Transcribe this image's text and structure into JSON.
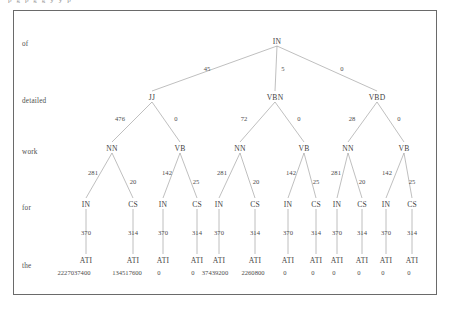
{
  "figure": {
    "caption_fragment": "p g p g g y y p",
    "row_labels": [
      {
        "text": "of",
        "x": 22,
        "y": 40
      },
      {
        "text": "detailed",
        "x": 22,
        "y": 97
      },
      {
        "text": "work",
        "x": 22,
        "y": 148
      },
      {
        "text": "for",
        "x": 22,
        "y": 204
      },
      {
        "text": "the",
        "x": 22,
        "y": 262
      }
    ],
    "nodes": [
      {
        "id": "root",
        "label": "IN",
        "x": 277,
        "y": 41
      },
      {
        "id": "l1a",
        "label": "JJ",
        "x": 152,
        "y": 97
      },
      {
        "id": "l1b",
        "label": "VBN",
        "x": 275,
        "y": 97
      },
      {
        "id": "l1c",
        "label": "VBD",
        "x": 377,
        "y": 97
      },
      {
        "id": "l2a",
        "label": "NN",
        "x": 112,
        "y": 148
      },
      {
        "id": "l2b",
        "label": "VB",
        "x": 180,
        "y": 148
      },
      {
        "id": "l2c",
        "label": "NN",
        "x": 240,
        "y": 148
      },
      {
        "id": "l2d",
        "label": "VB",
        "x": 304,
        "y": 148
      },
      {
        "id": "l2e",
        "label": "NN",
        "x": 348,
        "y": 148
      },
      {
        "id": "l2f",
        "label": "VB",
        "x": 404,
        "y": 148
      },
      {
        "id": "l3a",
        "label": "IN",
        "x": 86,
        "y": 204
      },
      {
        "id": "l3b",
        "label": "CS",
        "x": 133,
        "y": 204
      },
      {
        "id": "l3c",
        "label": "IN",
        "x": 163,
        "y": 204
      },
      {
        "id": "l3d",
        "label": "CS",
        "x": 197,
        "y": 204
      },
      {
        "id": "l3e",
        "label": "IN",
        "x": 219,
        "y": 204
      },
      {
        "id": "l3f",
        "label": "CS",
        "x": 255,
        "y": 204
      },
      {
        "id": "l3g",
        "label": "IN",
        "x": 288,
        "y": 204
      },
      {
        "id": "l3h",
        "label": "CS",
        "x": 316,
        "y": 204
      },
      {
        "id": "l3i",
        "label": "IN",
        "x": 337,
        "y": 204
      },
      {
        "id": "l3j",
        "label": "CS",
        "x": 362,
        "y": 204
      },
      {
        "id": "l3k",
        "label": "IN",
        "x": 386,
        "y": 204
      },
      {
        "id": "l3l",
        "label": "CS",
        "x": 412,
        "y": 204
      },
      {
        "id": "l4a",
        "label": "ATI",
        "x": 86,
        "y": 260
      },
      {
        "id": "l4b",
        "label": "ATI",
        "x": 133,
        "y": 260
      },
      {
        "id": "l4c",
        "label": "ATI",
        "x": 163,
        "y": 260
      },
      {
        "id": "l4d",
        "label": "ATI",
        "x": 197,
        "y": 260
      },
      {
        "id": "l4e",
        "label": "ATI",
        "x": 219,
        "y": 260
      },
      {
        "id": "l4f",
        "label": "ATI",
        "x": 255,
        "y": 260
      },
      {
        "id": "l4g",
        "label": "ATI",
        "x": 288,
        "y": 260
      },
      {
        "id": "l4h",
        "label": "ATI",
        "x": 316,
        "y": 260
      },
      {
        "id": "l4i",
        "label": "ATI",
        "x": 337,
        "y": 260
      },
      {
        "id": "l4j",
        "label": "ATI",
        "x": 362,
        "y": 260
      },
      {
        "id": "l4k",
        "label": "ATI",
        "x": 386,
        "y": 260
      },
      {
        "id": "l4l",
        "label": "ATI",
        "x": 412,
        "y": 260
      }
    ],
    "edges": [
      {
        "x1": 277,
        "y1": 46,
        "x2": 152,
        "y2": 91
      },
      {
        "x1": 277,
        "y1": 46,
        "x2": 275,
        "y2": 91
      },
      {
        "x1": 277,
        "y1": 46,
        "x2": 377,
        "y2": 91
      },
      {
        "x1": 152,
        "y1": 102,
        "x2": 112,
        "y2": 142
      },
      {
        "x1": 152,
        "y1": 102,
        "x2": 180,
        "y2": 142
      },
      {
        "x1": 275,
        "y1": 102,
        "x2": 240,
        "y2": 142
      },
      {
        "x1": 275,
        "y1": 102,
        "x2": 304,
        "y2": 142
      },
      {
        "x1": 377,
        "y1": 102,
        "x2": 348,
        "y2": 142
      },
      {
        "x1": 377,
        "y1": 102,
        "x2": 404,
        "y2": 142
      },
      {
        "x1": 112,
        "y1": 153,
        "x2": 86,
        "y2": 198
      },
      {
        "x1": 112,
        "y1": 153,
        "x2": 133,
        "y2": 198
      },
      {
        "x1": 180,
        "y1": 153,
        "x2": 163,
        "y2": 198
      },
      {
        "x1": 180,
        "y1": 153,
        "x2": 197,
        "y2": 198
      },
      {
        "x1": 240,
        "y1": 153,
        "x2": 219,
        "y2": 198
      },
      {
        "x1": 240,
        "y1": 153,
        "x2": 255,
        "y2": 198
      },
      {
        "x1": 304,
        "y1": 153,
        "x2": 288,
        "y2": 198
      },
      {
        "x1": 304,
        "y1": 153,
        "x2": 316,
        "y2": 198
      },
      {
        "x1": 348,
        "y1": 153,
        "x2": 337,
        "y2": 198
      },
      {
        "x1": 348,
        "y1": 153,
        "x2": 362,
        "y2": 198
      },
      {
        "x1": 404,
        "y1": 153,
        "x2": 386,
        "y2": 198
      },
      {
        "x1": 404,
        "y1": 153,
        "x2": 412,
        "y2": 198
      },
      {
        "x1": 86,
        "y1": 209,
        "x2": 86,
        "y2": 254
      },
      {
        "x1": 133,
        "y1": 209,
        "x2": 133,
        "y2": 254
      },
      {
        "x1": 163,
        "y1": 209,
        "x2": 163,
        "y2": 254
      },
      {
        "x1": 197,
        "y1": 209,
        "x2": 197,
        "y2": 254
      },
      {
        "x1": 219,
        "y1": 209,
        "x2": 219,
        "y2": 254
      },
      {
        "x1": 255,
        "y1": 209,
        "x2": 255,
        "y2": 254
      },
      {
        "x1": 288,
        "y1": 209,
        "x2": 288,
        "y2": 254
      },
      {
        "x1": 316,
        "y1": 209,
        "x2": 316,
        "y2": 254
      },
      {
        "x1": 337,
        "y1": 209,
        "x2": 337,
        "y2": 254
      },
      {
        "x1": 362,
        "y1": 209,
        "x2": 362,
        "y2": 254
      },
      {
        "x1": 386,
        "y1": 209,
        "x2": 386,
        "y2": 254
      },
      {
        "x1": 412,
        "y1": 209,
        "x2": 412,
        "y2": 254
      }
    ],
    "edge_labels": [
      {
        "text": "45",
        "x": 207,
        "y": 68
      },
      {
        "text": "5",
        "x": 283,
        "y": 68
      },
      {
        "text": "0",
        "x": 342,
        "y": 68
      },
      {
        "text": "476",
        "x": 120,
        "y": 118
      },
      {
        "text": "0",
        "x": 176,
        "y": 118
      },
      {
        "text": "72",
        "x": 244,
        "y": 118
      },
      {
        "text": "0",
        "x": 299,
        "y": 118
      },
      {
        "text": "28",
        "x": 352,
        "y": 118
      },
      {
        "text": "0",
        "x": 399,
        "y": 118
      },
      {
        "text": "281",
        "x": 93,
        "y": 172
      },
      {
        "text": "20",
        "x": 133,
        "y": 181
      },
      {
        "text": "142",
        "x": 167,
        "y": 172
      },
      {
        "text": "25",
        "x": 196,
        "y": 181
      },
      {
        "text": "281",
        "x": 222,
        "y": 172
      },
      {
        "text": "20",
        "x": 256,
        "y": 181
      },
      {
        "text": "142",
        "x": 291,
        "y": 172
      },
      {
        "text": "25",
        "x": 316,
        "y": 181
      },
      {
        "text": "281",
        "x": 336,
        "y": 172
      },
      {
        "text": "20",
        "x": 362,
        "y": 181
      },
      {
        "text": "142",
        "x": 387,
        "y": 172
      },
      {
        "text": "25",
        "x": 412,
        "y": 181
      },
      {
        "text": "370",
        "x": 86,
        "y": 232
      },
      {
        "text": "314",
        "x": 133,
        "y": 232
      },
      {
        "text": "370",
        "x": 163,
        "y": 232
      },
      {
        "text": "314",
        "x": 197,
        "y": 232
      },
      {
        "text": "370",
        "x": 219,
        "y": 232
      },
      {
        "text": "314",
        "x": 255,
        "y": 232
      },
      {
        "text": "370",
        "x": 288,
        "y": 232
      },
      {
        "text": "314",
        "x": 316,
        "y": 232
      },
      {
        "text": "370",
        "x": 337,
        "y": 232
      },
      {
        "text": "314",
        "x": 362,
        "y": 232
      },
      {
        "text": "370",
        "x": 386,
        "y": 232
      },
      {
        "text": "314",
        "x": 412,
        "y": 232
      }
    ],
    "leaf_values": [
      {
        "text": "2227037400",
        "x": 74,
        "y": 272
      },
      {
        "text": "134517600",
        "x": 127,
        "y": 272
      },
      {
        "text": "0",
        "x": 159,
        "y": 272
      },
      {
        "text": "0",
        "x": 193,
        "y": 272
      },
      {
        "text": "37439200",
        "x": 215,
        "y": 272
      },
      {
        "text": "2260800",
        "x": 253,
        "y": 272
      },
      {
        "text": "0",
        "x": 285,
        "y": 272
      },
      {
        "text": "0",
        "x": 313,
        "y": 272
      },
      {
        "text": "0",
        "x": 334,
        "y": 272
      },
      {
        "text": "0",
        "x": 359,
        "y": 272
      },
      {
        "text": "0",
        "x": 383,
        "y": 272
      },
      {
        "text": "0",
        "x": 409,
        "y": 272
      }
    ],
    "colors": {
      "line": "#8a8a8a",
      "text": "#454545",
      "frame": "#6a6a6a",
      "background": "#ffffff"
    }
  }
}
